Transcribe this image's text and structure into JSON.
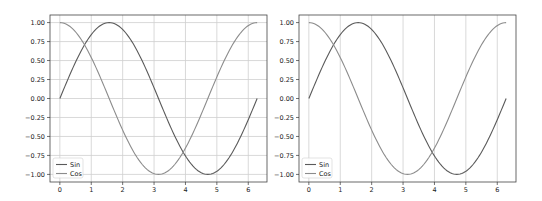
{
  "chart_data": [
    {
      "type": "line",
      "title": "",
      "xlabel": "",
      "ylabel": "",
      "xlim": [
        -0.314,
        6.597
      ],
      "ylim": [
        -1.1,
        1.1
      ],
      "grid": "both",
      "x_ticks": [
        "0",
        "1",
        "2",
        "3",
        "4",
        "5",
        "6"
      ],
      "y_ticks": [
        "1.00",
        "0.75",
        "0.50",
        "0.25",
        "0.00",
        "−0.25",
        "−0.50",
        "−0.75",
        "−1.00"
      ],
      "legend_position": "lower left",
      "series": [
        {
          "name": "Sin",
          "function": "sin(x)",
          "x_range": [
            0,
            6.283
          ],
          "color": "#5a5a5a",
          "x": [
            0,
            0.785,
            1.571,
            2.356,
            3.142,
            3.927,
            4.712,
            5.498,
            6.283
          ],
          "values": [
            0,
            0.71,
            1.0,
            0.71,
            0,
            -0.71,
            -1.0,
            -0.71,
            0
          ]
        },
        {
          "name": "Cos",
          "function": "cos(x)",
          "x_range": [
            0,
            6.283
          ],
          "color": "#8c8c8c",
          "x": [
            0,
            0.785,
            1.571,
            2.356,
            3.142,
            3.927,
            4.712,
            5.498,
            6.283
          ],
          "values": [
            1.0,
            0.71,
            0,
            -0.71,
            -1.0,
            -0.71,
            0,
            0.71,
            1.0
          ]
        }
      ]
    },
    {
      "type": "line",
      "title": "",
      "xlabel": "",
      "ylabel": "",
      "xlim": [
        -0.314,
        6.597
      ],
      "ylim": [
        -1.1,
        1.1
      ],
      "grid": "x",
      "x_ticks": [
        "0",
        "1",
        "2",
        "3",
        "4",
        "5",
        "6"
      ],
      "y_ticks": [
        "1.00",
        "0.75",
        "0.50",
        "0.25",
        "0.00",
        "−0.25",
        "−0.50",
        "−0.75",
        "−1.00"
      ],
      "legend_position": "lower left",
      "series": [
        {
          "name": "Sin",
          "function": "sin(x)",
          "x_range": [
            0,
            6.283
          ],
          "color": "#5a5a5a",
          "x": [
            0,
            0.785,
            1.571,
            2.356,
            3.142,
            3.927,
            4.712,
            5.498,
            6.283
          ],
          "values": [
            0,
            0.71,
            1.0,
            0.71,
            0,
            -0.71,
            -1.0,
            -0.71,
            0
          ]
        },
        {
          "name": "Cos",
          "function": "cos(x)",
          "x_range": [
            0,
            6.283
          ],
          "color": "#8c8c8c",
          "x": [
            0,
            0.785,
            1.571,
            2.356,
            3.142,
            3.927,
            4.712,
            5.498,
            6.283
          ],
          "values": [
            1.0,
            0.71,
            0,
            -0.71,
            -1.0,
            -0.71,
            0,
            0.71,
            1.0
          ]
        }
      ]
    }
  ],
  "layout": {
    "plots": [
      {
        "left": 50,
        "top": 15,
        "width": 217,
        "height": 167
      },
      {
        "left": 299,
        "top": 15,
        "width": 217,
        "height": 167
      }
    ],
    "grid_color": "#cfcfcf",
    "frame_color": "#444444"
  }
}
